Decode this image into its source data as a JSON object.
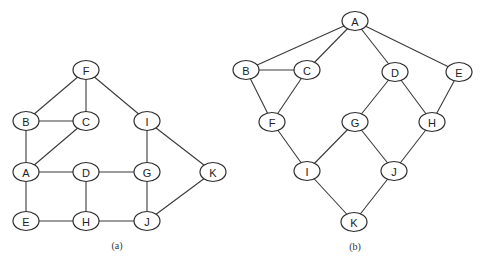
{
  "colors": {
    "stroke": "#2e2e2e",
    "edge": "#3a3a3a",
    "fill": "#ffffff",
    "text": "#222222"
  },
  "node_size": {
    "rx": 13,
    "ry": 9.5
  },
  "graphs": [
    {
      "id": "a",
      "caption": "(a)",
      "caption_pos": {
        "x": 117,
        "y": 245
      },
      "nodes": [
        {
          "id": "F",
          "x": 86,
          "y": 70
        },
        {
          "id": "B",
          "x": 26,
          "y": 121
        },
        {
          "id": "C",
          "x": 86,
          "y": 121
        },
        {
          "id": "I",
          "x": 147,
          "y": 121
        },
        {
          "id": "A",
          "x": 26,
          "y": 172
        },
        {
          "id": "D",
          "x": 86,
          "y": 172
        },
        {
          "id": "G",
          "x": 147,
          "y": 172
        },
        {
          "id": "K",
          "x": 213,
          "y": 172
        },
        {
          "id": "E",
          "x": 26,
          "y": 221
        },
        {
          "id": "H",
          "x": 86,
          "y": 221
        },
        {
          "id": "J",
          "x": 147,
          "y": 221
        }
      ],
      "edges": [
        [
          "F",
          "B"
        ],
        [
          "F",
          "C"
        ],
        [
          "F",
          "I"
        ],
        [
          "B",
          "C"
        ],
        [
          "B",
          "A"
        ],
        [
          "C",
          "A"
        ],
        [
          "I",
          "G"
        ],
        [
          "I",
          "K"
        ],
        [
          "A",
          "D"
        ],
        [
          "D",
          "G"
        ],
        [
          "A",
          "E"
        ],
        [
          "D",
          "H"
        ],
        [
          "G",
          "J"
        ],
        [
          "K",
          "J"
        ],
        [
          "E",
          "H"
        ],
        [
          "H",
          "J"
        ]
      ]
    },
    {
      "id": "b",
      "caption": "(b)",
      "caption_pos": {
        "x": 355,
        "y": 246
      },
      "nodes": [
        {
          "id": "A",
          "x": 355,
          "y": 21
        },
        {
          "id": "B",
          "x": 246,
          "y": 70
        },
        {
          "id": "C",
          "x": 307,
          "y": 70
        },
        {
          "id": "D",
          "x": 395,
          "y": 72
        },
        {
          "id": "E",
          "x": 459,
          "y": 72
        },
        {
          "id": "F",
          "x": 272,
          "y": 122
        },
        {
          "id": "G",
          "x": 355,
          "y": 122
        },
        {
          "id": "H",
          "x": 432,
          "y": 122
        },
        {
          "id": "I",
          "x": 307,
          "y": 171
        },
        {
          "id": "J",
          "x": 394,
          "y": 171
        },
        {
          "id": "K",
          "x": 354,
          "y": 222
        }
      ],
      "edges": [
        [
          "A",
          "B"
        ],
        [
          "A",
          "C"
        ],
        [
          "A",
          "D"
        ],
        [
          "A",
          "E"
        ],
        [
          "B",
          "C"
        ],
        [
          "B",
          "F"
        ],
        [
          "C",
          "F"
        ],
        [
          "D",
          "G"
        ],
        [
          "D",
          "H"
        ],
        [
          "E",
          "H"
        ],
        [
          "F",
          "I"
        ],
        [
          "G",
          "I"
        ],
        [
          "G",
          "J"
        ],
        [
          "H",
          "J"
        ],
        [
          "I",
          "K"
        ],
        [
          "J",
          "K"
        ]
      ]
    }
  ]
}
